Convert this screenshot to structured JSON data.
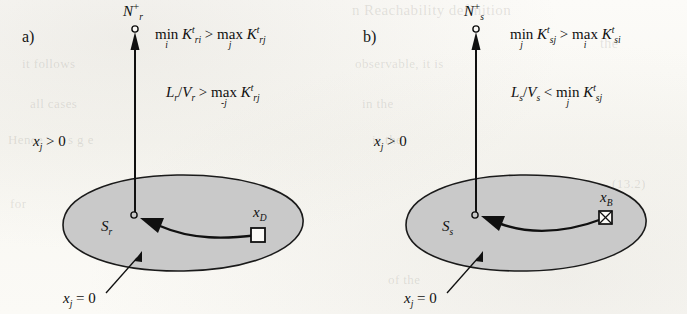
{
  "figure": {
    "type": "diagram",
    "background_color": "#fbfaf7",
    "ellipse_fill": "#c9c9c9",
    "ink_color": "#101010"
  },
  "ghost_texts": [
    {
      "text": "n  Reachability definition",
      "x": 352,
      "y": 2,
      "size": 15
    },
    {
      "text": "the",
      "x": 600,
      "y": 36,
      "size": 14
    },
    {
      "text": "it follows",
      "x": 22,
      "y": 56,
      "size": 13
    },
    {
      "text": "observable, it is",
      "x": 355,
      "y": 56,
      "size": 13
    },
    {
      "text": "all cases",
      "x": 30,
      "y": 96,
      "size": 13
    },
    {
      "text": "in the",
      "x": 362,
      "y": 96,
      "size": 13
    },
    {
      "text": "Hence",
      "x": 8,
      "y": 132,
      "size": 13
    },
    {
      "text": "s  g  e",
      "x": 68,
      "y": 132,
      "size": 13
    },
    {
      "text": "is the",
      "x": 372,
      "y": 132,
      "size": 13
    },
    {
      "text": "(13.2)",
      "x": 612,
      "y": 176,
      "size": 13
    },
    {
      "text": "for",
      "x": 10,
      "y": 196,
      "size": 13
    },
    {
      "text": "(15)",
      "x": 608,
      "y": 212,
      "size": 13
    },
    {
      "text": "of  the",
      "x": 388,
      "y": 272,
      "size": 13
    }
  ],
  "panels": [
    {
      "id": "a",
      "label": "a)",
      "top_node_label": {
        "base": "N",
        "sub": "r",
        "sup": "+"
      },
      "set_label": {
        "base": "S",
        "sub": "r"
      },
      "target_label": {
        "base": "x",
        "sub": "D"
      },
      "target_marker": "open-square",
      "region_annotation": {
        "base": "x",
        "sub": "j",
        "rel": "= 0"
      },
      "outside_annotation": {
        "base": "x",
        "sub": "j",
        "rel": "> 0"
      },
      "formulas": [
        {
          "id": "a-eq1",
          "parts": [
            {
              "kind": "op",
              "name": "min",
              "limit": "i"
            },
            {
              "kind": "var",
              "base": "K",
              "sup": "t",
              "sub": "ri"
            },
            {
              "kind": "rel",
              "text": ">"
            },
            {
              "kind": "op",
              "name": "max",
              "limit": "j"
            },
            {
              "kind": "var",
              "base": "K",
              "sup": "t",
              "sub": "rj"
            }
          ],
          "plain": "min_i K^t_ri > max_j K^t_rj"
        },
        {
          "id": "a-eq2",
          "parts": [
            {
              "kind": "var",
              "base": "L",
              "sub": "r"
            },
            {
              "kind": "rel",
              "text": "/"
            },
            {
              "kind": "var",
              "base": "V",
              "sub": "r"
            },
            {
              "kind": "rel",
              "text": ">"
            },
            {
              "kind": "op",
              "name": "max",
              "limit": "-j"
            },
            {
              "kind": "var",
              "base": "K",
              "sup": "t",
              "sub": "rj"
            }
          ],
          "plain": "L_r/V_r > max_-j K^t_rj"
        }
      ]
    },
    {
      "id": "b",
      "label": "b)",
      "top_node_label": {
        "base": "N",
        "sub": "s",
        "sup": "+"
      },
      "set_label": {
        "base": "S",
        "sub": "s"
      },
      "target_label": {
        "base": "x",
        "sub": "B"
      },
      "target_marker": "crossed-square",
      "region_annotation": {
        "base": "x",
        "sub": "j",
        "rel": "= 0"
      },
      "outside_annotation": {
        "base": "x",
        "sub": "j",
        "rel": "> 0"
      },
      "formulas": [
        {
          "id": "b-eq1",
          "parts": [
            {
              "kind": "op",
              "name": "min",
              "limit": "j"
            },
            {
              "kind": "var",
              "base": "K",
              "sup": "t",
              "sub": "sj"
            },
            {
              "kind": "rel",
              "text": ">"
            },
            {
              "kind": "op",
              "name": "max",
              "limit": "i"
            },
            {
              "kind": "var",
              "base": "K",
              "sup": "t",
              "sub": "si"
            }
          ],
          "plain": "min_j K^t_sj > max_i K^t_si"
        },
        {
          "id": "b-eq2",
          "parts": [
            {
              "kind": "var",
              "base": "L",
              "sub": "s"
            },
            {
              "kind": "rel",
              "text": "/"
            },
            {
              "kind": "var",
              "base": "V",
              "sub": "s"
            },
            {
              "kind": "rel",
              "text": "<"
            },
            {
              "kind": "op",
              "name": "min",
              "limit": "j"
            },
            {
              "kind": "var",
              "base": "K",
              "sup": "t",
              "sub": "sj"
            }
          ],
          "plain": "L_s/V_s < min_j K^t_sj"
        }
      ]
    }
  ]
}
